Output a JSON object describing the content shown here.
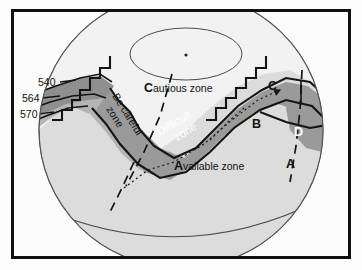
{
  "figure": {
    "kind": "geologic-zone-map-on-sphere",
    "frame": {
      "border_color": "#101010",
      "background": "#fcfcfc"
    }
  },
  "colors": {
    "page_background": "#ffffff",
    "frame_border": "#101010",
    "sphere_fill": "#dcdcdc",
    "cautious_zone_fill": "#f2f2f2",
    "available_zone_fill": "#dcdcdc",
    "be_careful_zone_fill": "#b4b4b4",
    "difficult_zone_fill": "#9a9a9a",
    "band_dark_fill": "#8f8f8f",
    "region_d_fill": "#9a9a9a",
    "outline": "#1a1a1a",
    "label_dark": "#111111",
    "label_light": "#ffffff"
  },
  "contour_labels": [
    {
      "id": "contour-540",
      "value": "540"
    },
    {
      "id": "contour-564",
      "value": "564"
    },
    {
      "id": "contour-570",
      "value": "570"
    }
  ],
  "zone_labels": [
    {
      "id": "cautious-zone",
      "text": "Cautious zone",
      "cap": "C",
      "rest": "autious zone",
      "color": "#111111",
      "rotation": 0
    },
    {
      "id": "available-zone",
      "text": "Available zone",
      "cap": "A",
      "rest": "vailable zone",
      "color": "#111111",
      "rotation": 0
    },
    {
      "id": "difficult-zone",
      "line1": "Difficult",
      "line2": "zone",
      "text": "Difficult zone",
      "color": "#ffffff",
      "rotation": 30
    },
    {
      "id": "be-careful-zone",
      "line1": "Be careful",
      "line2": "zone",
      "text": "Be careful zone",
      "color": "#111111",
      "rotation": 62
    }
  ],
  "region_letters": [
    {
      "id": "region-a",
      "letter": "A",
      "color": "#111111"
    },
    {
      "id": "region-b",
      "letter": "B",
      "color": "#111111"
    },
    {
      "id": "region-c",
      "letter": "C",
      "color": "#111111"
    },
    {
      "id": "region-d",
      "letter": "D",
      "color": "#ffffff"
    }
  ],
  "features": {
    "polar_ellipse": "polar cap outline with centre dot",
    "latitude_arc": "lower latitude arc across sphere",
    "dashed_meridians": 3,
    "dotted_trajectory_arrow": 1,
    "zigzag_fault_segments": 2
  }
}
